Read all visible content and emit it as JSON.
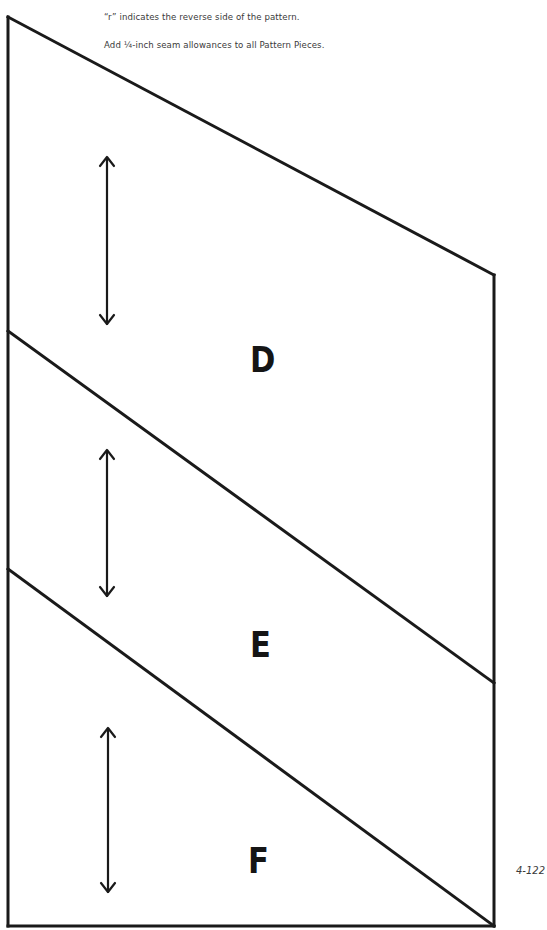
{
  "notes": {
    "reverse_side": "“r” indicates the reverse side of the pattern.",
    "seam_allowance": "Add ¼-inch seam allowances to all Pattern Pieces."
  },
  "pieces": [
    {
      "label": "D",
      "grainline": "vertical-double-arrow"
    },
    {
      "label": "E",
      "grainline": "vertical-double-arrow"
    },
    {
      "label": "F",
      "grainline": "vertical-double-arrow"
    }
  ],
  "page_number": "4-122",
  "colors": {
    "line": "#1a1a1a",
    "text": "#3a3a3a",
    "background": "#ffffff"
  }
}
